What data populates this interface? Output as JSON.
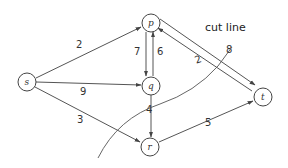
{
  "diagram": {
    "type": "flow-network",
    "nodes": [
      {
        "id": "s",
        "label": "s",
        "x": 27,
        "y": 82
      },
      {
        "id": "p",
        "label": "p",
        "x": 151,
        "y": 23
      },
      {
        "id": "q",
        "label": "q",
        "x": 151,
        "y": 86
      },
      {
        "id": "r",
        "label": "r",
        "x": 150,
        "y": 147
      },
      {
        "id": "t",
        "label": "t",
        "x": 263,
        "y": 97
      }
    ],
    "edges": [
      {
        "from": "s",
        "to": "p",
        "weight": "2"
      },
      {
        "from": "s",
        "to": "q",
        "weight": "9"
      },
      {
        "from": "s",
        "to": "r",
        "weight": "3"
      },
      {
        "from": "p",
        "to": "q",
        "weight": "7"
      },
      {
        "from": "q",
        "to": "p",
        "weight": "6"
      },
      {
        "from": "p",
        "to": "t",
        "weight": "8"
      },
      {
        "from": "t",
        "to": "p",
        "weight": "2"
      },
      {
        "from": "q",
        "to": "r",
        "weight": "4"
      },
      {
        "from": "r",
        "to": "t",
        "weight": "5"
      }
    ],
    "cut_label": "cut line",
    "colors": {
      "stroke": "#555555",
      "text": "#333333",
      "background": "#ffffff"
    }
  }
}
